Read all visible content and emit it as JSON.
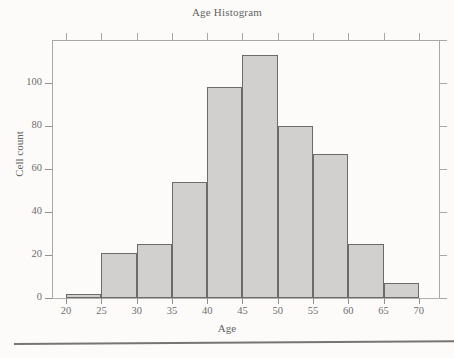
{
  "chart_data": {
    "type": "bar",
    "title": "Age Histogram",
    "xlabel": "Age",
    "ylabel": "Cell count",
    "bin_width": 5,
    "bin_edges": [
      20,
      25,
      30,
      35,
      40,
      45,
      50,
      55,
      60,
      65,
      70
    ],
    "categories": [
      "20-25",
      "25-30",
      "30-35",
      "35-40",
      "40-45",
      "45-50",
      "50-55",
      "55-60",
      "60-65",
      "65-70"
    ],
    "values": [
      2,
      21,
      25,
      54,
      98,
      113,
      80,
      67,
      25,
      7
    ],
    "xlim": [
      18,
      73
    ],
    "ylim": [
      0,
      120
    ],
    "xticks": [
      20,
      25,
      30,
      35,
      40,
      45,
      50,
      55,
      60,
      65,
      70
    ],
    "yticks": [
      0,
      20,
      40,
      60,
      80,
      100
    ],
    "xtick_labels": [
      "20",
      "25",
      "30",
      "35",
      "40",
      "45",
      "50",
      "55",
      "60",
      "65",
      "70"
    ],
    "ytick_labels": [
      "0",
      "20",
      "40",
      "60",
      "80",
      "100"
    ],
    "grid": false,
    "legend": null,
    "bar_fill_color": "#c3c3c3",
    "bar_edge_color": "#3d3d3d",
    "axis_color": "#8d8d8d",
    "text_color": "#2e2e2e"
  },
  "figure": {
    "background_color": "#fdfdfc",
    "page_rule_color": "#4a4a4a"
  }
}
